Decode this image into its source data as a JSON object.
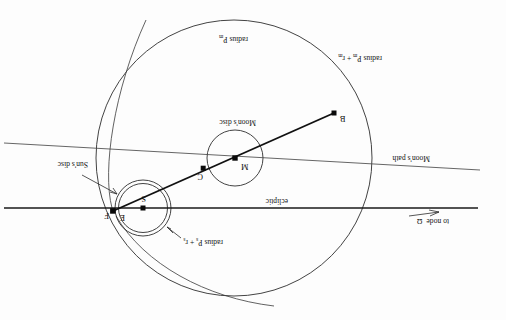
{
  "figure": {
    "orientation": "rotated-180",
    "background_color": "#fdfdfd",
    "ink_color": "#1a1a1a"
  },
  "labels": {
    "to_node": "to node",
    "node_symbol": "Ω",
    "ecliptic": "ecliptic",
    "moons_path": "Moon's path",
    "moons_disc": "Moon's disc",
    "suns_disc": "Sun's disc",
    "radius_sun_prefix": "radius P",
    "radius_sun_sub1": "s",
    "radius_sun_plus": " + r",
    "radius_sun_sub2": "s",
    "radius_moon_sum_prefix": "radius P",
    "radius_moon_sum_sub1": "m",
    "radius_moon_sum_plus": " + r",
    "radius_moon_sum_sub2": "m",
    "radius_moon_prefix": "radius P",
    "radius_moon_sub": "m"
  },
  "points": [
    {
      "id": "M",
      "label": "M",
      "x": 271,
      "y": 162,
      "marker": "square",
      "description": "Moon centre"
    },
    {
      "id": "C",
      "label": "C",
      "x": 303,
      "y": 152,
      "marker": "square",
      "description": "point on Moon's path"
    },
    {
      "id": "S",
      "label": "S",
      "x": 363,
      "y": 112,
      "marker": "square",
      "description": "Sun centre"
    },
    {
      "id": "E",
      "label": "E",
      "x": 388,
      "y": 106,
      "marker": "none",
      "description": "point E near Sun limb"
    },
    {
      "id": "F",
      "label": "F",
      "x": 393,
      "y": 109,
      "marker": "square",
      "description": "point F on outer arc"
    },
    {
      "id": "B",
      "label": "B",
      "x": 172,
      "y": 207,
      "marker": "square",
      "description": "far end of chord"
    }
  ],
  "circles": [
    {
      "id": "penumbra-big",
      "cx": 272,
      "cy": 162,
      "r": 138,
      "label_ref": "radius_moon"
    },
    {
      "id": "moons-disc",
      "cx": 271,
      "cy": 162,
      "r": 28,
      "label_ref": "moons_disc"
    },
    {
      "id": "suns-disc-outer",
      "cx": 363,
      "cy": 112,
      "r": 28,
      "label_ref": "radius_sun"
    },
    {
      "id": "suns-disc-inner",
      "cx": 363,
      "cy": 112,
      "r": 24.5,
      "label_ref": "suns_disc"
    }
  ],
  "lines": {
    "ecliptic": {
      "x1": 28,
      "y1": 112,
      "x2": 500,
      "y2": 112
    },
    "moons_path": {
      "x1": 26,
      "y1": 150,
      "x2": 500,
      "y2": 176
    },
    "chord_BF": {
      "x1": 172,
      "y1": 207,
      "x2": 393,
      "y2": 109
    },
    "node_arrow": {
      "from_x": 97,
      "from_y": 104,
      "to_x": 66,
      "to_y": 108
    }
  },
  "arcs": {
    "outer_big_arc": "large circular arc of radius P_m + r_m passing through F",
    "sun_tangent_arc": "small arc of radius P_s + r_s around the Sun's disc"
  }
}
